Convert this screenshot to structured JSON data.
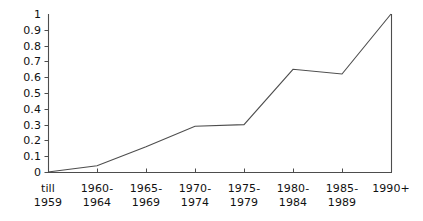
{
  "chart_data": {
    "type": "line",
    "title": "",
    "subtitle": "",
    "xlabel": "",
    "ylabel": "",
    "categories": [
      "till\n1959",
      "1960-\n1964",
      "1965-\n1969",
      "1970-\n1974",
      "1975-\n1979",
      "1980-\n1984",
      "1985-\n1989",
      "1990+"
    ],
    "values": [
      0,
      0.04,
      0.16,
      0.29,
      0.3,
      0.65,
      0.62,
      1
    ],
    "ylim": [
      0,
      1
    ],
    "ytick_labels": [
      "0",
      "0.1",
      "0.2",
      "0.3",
      "0.4",
      "0.5",
      "0.6",
      "0.7",
      "0.8",
      "0.9",
      "1"
    ],
    "ytick_values": [
      0,
      0.1,
      0.2,
      0.3,
      0.4,
      0.5,
      0.6,
      0.7,
      0.8,
      0.9,
      1
    ],
    "grid": false,
    "legend": null,
    "legend_position": "none",
    "series_color": "#4d4d4d",
    "axis_color": "#4d4d4d"
  }
}
